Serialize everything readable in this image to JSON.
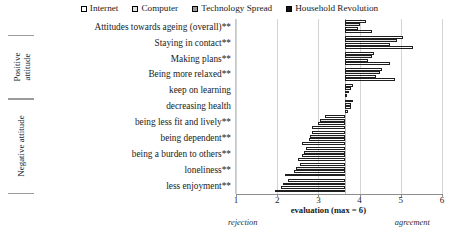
{
  "chart_data": {
    "type": "bar",
    "orientation": "horizontal",
    "title": "",
    "xlabel": "evaluation (max = 6)",
    "ylabel": "",
    "xlim": [
      1,
      6
    ],
    "xticks": [
      1,
      2,
      3,
      4,
      5,
      6
    ],
    "grid": true,
    "legend_position": "top-center",
    "baseline_value": 3.65,
    "axis_anchor_left": "rejection",
    "axis_anchor_right": "agreement",
    "categories": [
      "Attitudes towards ageing (overall)**",
      "Staying in contact**",
      "Making plans**",
      "Being more relaxed**",
      "keep on learning",
      "decreasing health",
      "being less fit and lively**",
      "being dependent**",
      "being a burden to others**",
      "loneliness**",
      "less enjoyment**"
    ],
    "groups": [
      {
        "label": "Positive attitude",
        "categories": [
          "Staying in contact**",
          "Making plans**",
          "Being more relaxed**",
          "keep on learning"
        ]
      },
      {
        "label": "Negative attitude",
        "categories": [
          "decreasing health",
          "being less fit and lively**",
          "being dependent**",
          "being a burden to others**",
          "loneliness**",
          "less enjoyment**"
        ]
      }
    ],
    "series": [
      {
        "name": "Internet",
        "color": "#ffffff",
        "values": [
          4.15,
          5.05,
          4.35,
          4.55,
          3.85,
          3.85,
          3.15,
          2.85,
          2.7,
          2.55,
          2.25
        ]
      },
      {
        "name": "Computer",
        "color": "#e2e2e2",
        "values": [
          4.0,
          4.9,
          4.3,
          4.5,
          3.8,
          3.8,
          3.05,
          2.8,
          2.65,
          2.45,
          2.15
        ]
      },
      {
        "name": "Technology Spread",
        "color": "#9a9a9a",
        "values": [
          3.95,
          4.75,
          4.2,
          4.4,
          3.75,
          3.78,
          3.0,
          2.78,
          2.6,
          2.4,
          2.1
        ]
      },
      {
        "name": "Household Revolution",
        "color": "#121212",
        "values": [
          4.3,
          5.3,
          4.75,
          4.85,
          3.65,
          3.72,
          2.85,
          2.6,
          2.5,
          2.2,
          1.95
        ]
      }
    ]
  },
  "legend": {
    "items": [
      {
        "label": "Internet"
      },
      {
        "label": "Computer"
      },
      {
        "label": "Technology Spread"
      },
      {
        "label": "Household Revolution"
      }
    ]
  },
  "axis": {
    "ticks": [
      "1",
      "2",
      "3",
      "4",
      "5",
      "6"
    ],
    "title": "evaluation (max = 6)",
    "left_anchor": "rejection",
    "right_anchor": "agreement"
  },
  "groups": {
    "positive": "Positive attitude",
    "negative": "Negative attitude"
  }
}
